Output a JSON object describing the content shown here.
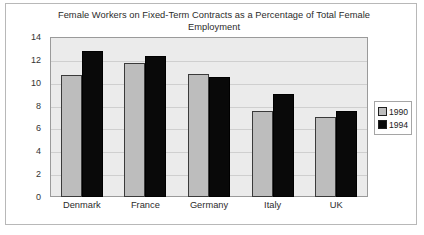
{
  "chart_data": {
    "type": "bar",
    "title": "Female Workers on Fixed-Term Contracts as a Percentage of Total Female Employment",
    "xlabel": "",
    "ylabel": "",
    "ylim": [
      0,
      14
    ],
    "ytick_step": 2,
    "yticks": [
      "14",
      "12",
      "10",
      "8",
      "6",
      "4",
      "2",
      "0"
    ],
    "grid": true,
    "legend_position": "right",
    "categories": [
      "Denmark",
      "France",
      "Germany",
      "Italy",
      "UK"
    ],
    "series": [
      {
        "name": "1990",
        "color": "#bdbdbd",
        "values": [
          10.7,
          11.7,
          10.8,
          7.5,
          7.0
        ]
      },
      {
        "name": "1994",
        "color": "#090909",
        "values": [
          12.8,
          12.3,
          10.5,
          9.0,
          7.5
        ]
      }
    ]
  },
  "legend": {
    "items": [
      {
        "label": "1990",
        "swatch": "legend-swatch-1990"
      },
      {
        "label": "1994",
        "swatch": "legend-swatch-1994"
      }
    ]
  }
}
